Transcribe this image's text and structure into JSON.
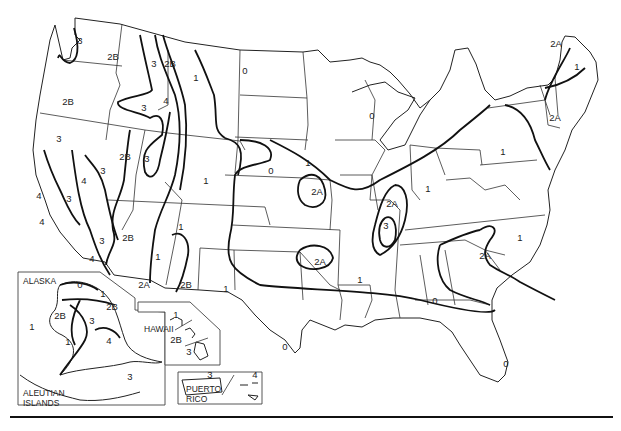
{
  "map": {
    "title": "Seismic zone map of the United States",
    "insets": [
      {
        "name": "ALASKA",
        "sub": "ALEUTIAN ISLANDS"
      },
      {
        "name": "HAWAII"
      },
      {
        "name": "PUERTO RICO"
      }
    ],
    "inset_names": {
      "alaska": "ALASKA",
      "aleutian_1": "ALEUTIAN",
      "aleutian_2": "ISLANDS",
      "hawaii": "HAWAII",
      "puerto_1": "PUERTO",
      "puerto_2": "RICO"
    },
    "zone_labels": [
      {
        "text": "3",
        "x": 80,
        "y": 41
      },
      {
        "text": "2B",
        "x": 113,
        "y": 57
      },
      {
        "text": "3",
        "x": 154,
        "y": 64
      },
      {
        "text": "2B",
        "x": 170,
        "y": 64
      },
      {
        "text": "1",
        "x": 196,
        "y": 78
      },
      {
        "text": "0",
        "x": 245,
        "y": 71
      },
      {
        "text": "2B",
        "x": 68,
        "y": 102
      },
      {
        "text": "4",
        "x": 166,
        "y": 101
      },
      {
        "text": "3",
        "x": 144,
        "y": 108
      },
      {
        "text": "3",
        "x": 59,
        "y": 139
      },
      {
        "text": "2B",
        "x": 125,
        "y": 157
      },
      {
        "text": "3",
        "x": 147,
        "y": 159
      },
      {
        "text": "3",
        "x": 103,
        "y": 171
      },
      {
        "text": "4",
        "x": 84,
        "y": 181
      },
      {
        "text": "4",
        "x": 39,
        "y": 196
      },
      {
        "text": "1",
        "x": 206,
        "y": 181
      },
      {
        "text": "3",
        "x": 69,
        "y": 199
      },
      {
        "text": "4",
        "x": 42,
        "y": 222
      },
      {
        "text": "3",
        "x": 102,
        "y": 241
      },
      {
        "text": "2B",
        "x": 128,
        "y": 238
      },
      {
        "text": "1",
        "x": 181,
        "y": 227
      },
      {
        "text": "1",
        "x": 158,
        "y": 257
      },
      {
        "text": "4",
        "x": 92,
        "y": 259
      },
      {
        "text": "2A",
        "x": 144,
        "y": 285
      },
      {
        "text": "2B",
        "x": 186,
        "y": 285
      },
      {
        "text": "1",
        "x": 226,
        "y": 289
      },
      {
        "text": "0",
        "x": 372,
        "y": 116
      },
      {
        "text": "0",
        "x": 271,
        "y": 171
      },
      {
        "text": "1",
        "x": 308,
        "y": 163
      },
      {
        "text": "2A",
        "x": 317,
        "y": 192
      },
      {
        "text": "2A",
        "x": 392,
        "y": 204
      },
      {
        "text": "3",
        "x": 386,
        "y": 226
      },
      {
        "text": "2A",
        "x": 320,
        "y": 262
      },
      {
        "text": "1",
        "x": 360,
        "y": 280
      },
      {
        "text": "1",
        "x": 428,
        "y": 189
      },
      {
        "text": "1",
        "x": 503,
        "y": 152
      },
      {
        "text": "2A",
        "x": 485,
        "y": 256
      },
      {
        "text": "1",
        "x": 520,
        "y": 238
      },
      {
        "text": "0",
        "x": 435,
        "y": 301
      },
      {
        "text": "0",
        "x": 285,
        "y": 347
      },
      {
        "text": "0",
        "x": 506,
        "y": 364
      },
      {
        "text": "2A",
        "x": 556,
        "y": 44
      },
      {
        "text": "1",
        "x": 577,
        "y": 67
      },
      {
        "text": "2A",
        "x": 555,
        "y": 118
      },
      {
        "text": "0",
        "x": 80,
        "y": 285
      },
      {
        "text": "1",
        "x": 103,
        "y": 294
      },
      {
        "text": "2B",
        "x": 112,
        "y": 307
      },
      {
        "text": "2B",
        "x": 60,
        "y": 316
      },
      {
        "text": "1",
        "x": 32,
        "y": 327
      },
      {
        "text": "3",
        "x": 92,
        "y": 321
      },
      {
        "text": "1",
        "x": 68,
        "y": 342
      },
      {
        "text": "4",
        "x": 109,
        "y": 341
      },
      {
        "text": "3",
        "x": 130,
        "y": 377
      },
      {
        "text": "1",
        "x": 176,
        "y": 315
      },
      {
        "text": "2B",
        "x": 176,
        "y": 340
      },
      {
        "text": "3",
        "x": 189,
        "y": 352
      },
      {
        "text": "3",
        "x": 210,
        "y": 375
      },
      {
        "text": "4",
        "x": 255,
        "y": 375
      }
    ]
  }
}
